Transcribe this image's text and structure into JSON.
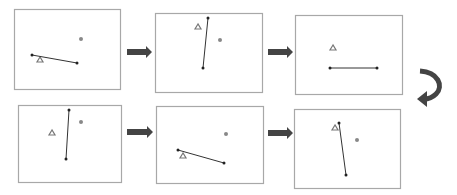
{
  "diagram": {
    "type": "sequence-of-frames",
    "colors": {
      "frame_border": "#a8a8a8",
      "line": "#333333",
      "endpoint": "#222222",
      "triangle": "#777777",
      "circle": "#888888",
      "arrow": "#444444"
    },
    "frames": [
      {
        "id": 1,
        "box": [
          14,
          9,
          120,
          89
        ],
        "line": [
          [
            32,
            55
          ],
          [
            77,
            63
          ]
        ],
        "triangle": [
          40,
          60
        ],
        "circle": [
          81,
          39
        ]
      },
      {
        "id": 2,
        "box": [
          155,
          13,
          262,
          92
        ],
        "line": [
          [
            208,
            18
          ],
          [
            203,
            68
          ]
        ],
        "triangle": [
          198,
          27
        ],
        "circle": [
          220,
          40
        ]
      },
      {
        "id": 3,
        "box": [
          295,
          15,
          402,
          94
        ],
        "line": [
          [
            330,
            68
          ],
          [
            377,
            68
          ]
        ],
        "triangle": [
          333,
          48
        ],
        "circle": null
      },
      {
        "id": 4,
        "box": [
          18,
          105,
          121,
          182
        ],
        "line": [
          [
            69,
            110
          ],
          [
            66,
            159
          ]
        ],
        "triangle": [
          52,
          133
        ],
        "circle": [
          81,
          122
        ]
      },
      {
        "id": 5,
        "box": [
          156,
          106,
          263,
          183
        ],
        "line": [
          [
            178,
            150
          ],
          [
            224,
            163
          ]
        ],
        "triangle": [
          183,
          156
        ],
        "circle": [
          226,
          134
        ]
      },
      {
        "id": 6,
        "box": [
          294,
          109,
          400,
          188
        ],
        "line": [
          [
            339,
            123
          ],
          [
            346,
            175
          ]
        ],
        "triangle": [
          335,
          128
        ],
        "circle": [
          357,
          140
        ]
      }
    ],
    "arrows": [
      {
        "from": 1,
        "to": 2,
        "x1": 127,
        "x2": 152,
        "y": 52
      },
      {
        "from": 2,
        "to": 3,
        "x1": 268,
        "x2": 293,
        "y": 52
      },
      {
        "from": 4,
        "to": 5,
        "x1": 127,
        "x2": 153,
        "y": 132
      },
      {
        "from": 5,
        "to": 6,
        "x1": 268,
        "x2": 293,
        "y": 133
      }
    ],
    "curved_arrow": {
      "from": 3,
      "to": 4
    }
  }
}
